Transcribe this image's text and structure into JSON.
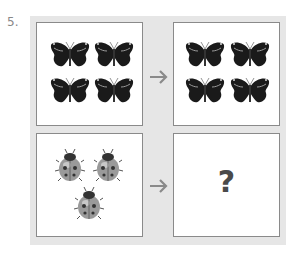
{
  "question": {
    "number": "5.",
    "rows": [
      {
        "left": {
          "item": "butterfly-icon",
          "count": 4
        },
        "arrow": "arrow-right-icon",
        "right": {
          "item": "butterfly-icon",
          "count": 4
        }
      },
      {
        "left": {
          "item": "ladybug-icon",
          "count": 3
        },
        "arrow": "arrow-right-icon",
        "right": {
          "unknown": "?"
        }
      }
    ]
  },
  "colors": {
    "panel": "#e6e6e6",
    "border": "#8a8a8a",
    "arrow": "#8a8a8a",
    "question_mark": "#4a4a4a"
  }
}
